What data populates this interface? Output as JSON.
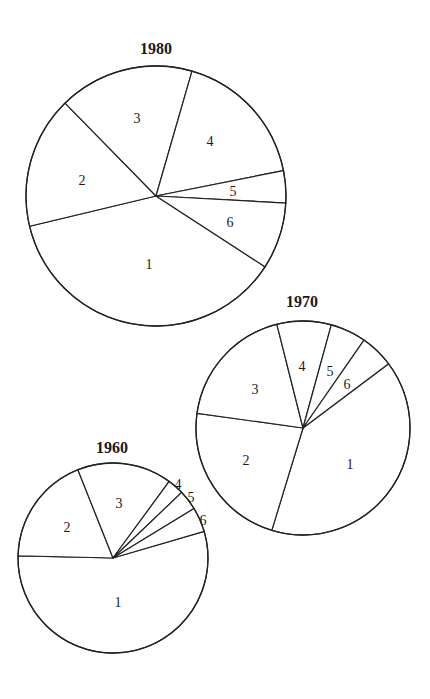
{
  "chart_data": [
    {
      "type": "pie",
      "title": "1980",
      "categories": [
        "1",
        "2",
        "3",
        "4",
        "5",
        "6"
      ],
      "values": [
        37.1,
        16.4,
        16.8,
        17.4,
        4.0,
        8.3
      ],
      "units": "percent (estimated from wedge angles)",
      "layout": {
        "cx": 156,
        "cy": 196,
        "r": 130,
        "start_angle_deg": 33,
        "direction": "clockwise",
        "title_x": 156,
        "title_y": 54
      },
      "label_positions": [
        [
          149,
          264
        ],
        [
          82,
          180
        ],
        [
          137,
          118
        ],
        [
          210,
          141
        ],
        [
          233,
          191
        ],
        [
          230,
          222
        ]
      ]
    },
    {
      "type": "pie",
      "title": "1970",
      "categories": [
        "1",
        "2",
        "3",
        "4",
        "5",
        "6"
      ],
      "values": [
        40.0,
        22.5,
        18.9,
        8.2,
        5.4,
        5.1
      ],
      "units": "percent (estimated from wedge angles)",
      "layout": {
        "cx": 303,
        "cy": 428,
        "r": 107,
        "start_angle_deg": 323.1,
        "direction": "clockwise",
        "title_x": 302,
        "title_y": 307
      },
      "label_positions": [
        [
          350,
          464
        ],
        [
          246,
          460
        ],
        [
          255,
          389
        ],
        [
          302,
          366
        ],
        [
          330,
          371
        ],
        [
          347,
          384
        ]
      ]
    },
    {
      "type": "pie",
      "title": "1960",
      "categories": [
        "1",
        "2",
        "3",
        "4",
        "5",
        "6"
      ],
      "values": [
        54.9,
        18.6,
        16.1,
        2.8,
        3.4,
        4.2
      ],
      "units": "percent (estimated from wedge angles)",
      "layout": {
        "cx": 113,
        "cy": 558,
        "r": 95,
        "start_angle_deg": 343.7,
        "direction": "clockwise",
        "title_x": 112,
        "title_y": 453
      },
      "label_positions": [
        [
          118,
          602
        ],
        [
          67,
          527
        ],
        [
          119,
          503
        ],
        [
          178,
          484
        ],
        [
          191,
          497
        ],
        [
          203,
          520
        ]
      ]
    }
  ]
}
